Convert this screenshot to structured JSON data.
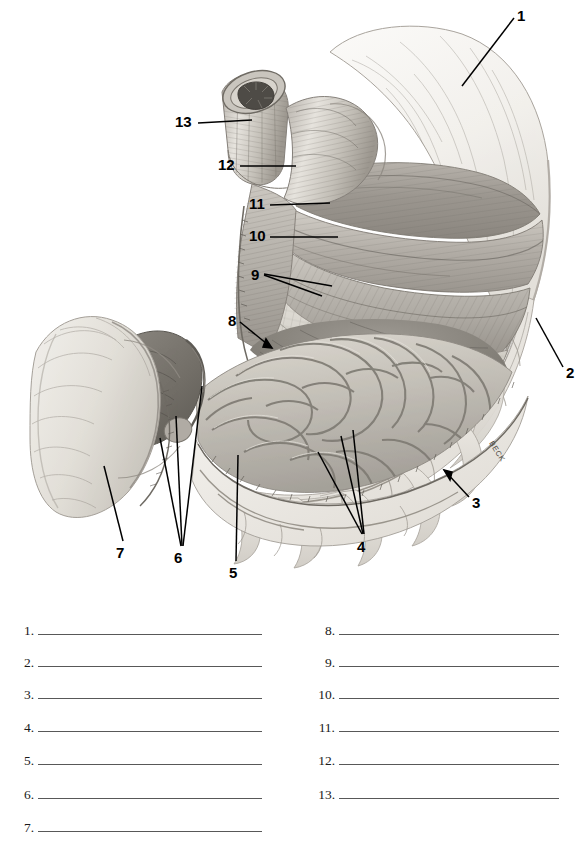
{
  "figure": {
    "artist_signature": "BECK",
    "callouts": [
      {
        "id": "1",
        "label": "1",
        "x": 517,
        "y": 8,
        "leader": "line"
      },
      {
        "id": "2",
        "label": "2",
        "x": 566,
        "y": 365,
        "leader": "line"
      },
      {
        "id": "3",
        "label": "3",
        "x": 472,
        "y": 495,
        "leader": "arrow"
      },
      {
        "id": "4",
        "label": "4",
        "x": 357,
        "y": 539,
        "leader": "triple-line"
      },
      {
        "id": "5",
        "label": "5",
        "x": 229,
        "y": 565,
        "leader": "line"
      },
      {
        "id": "6",
        "label": "6",
        "x": 174,
        "y": 550,
        "leader": "triple-line"
      },
      {
        "id": "7",
        "label": "7",
        "x": 116,
        "y": 545,
        "leader": "line"
      },
      {
        "id": "8",
        "label": "8",
        "x": 228,
        "y": 313,
        "leader": "arrow"
      },
      {
        "id": "9",
        "label": "9",
        "x": 251,
        "y": 267,
        "leader": "double-line"
      },
      {
        "id": "10",
        "label": "10",
        "x": 249,
        "y": 228,
        "leader": "line"
      },
      {
        "id": "11",
        "label": "11",
        "x": 249,
        "y": 196,
        "leader": "line"
      },
      {
        "id": "12",
        "label": "12",
        "x": 218,
        "y": 157,
        "leader": "line"
      },
      {
        "id": "13",
        "label": "13",
        "x": 175,
        "y": 114,
        "leader": "line"
      }
    ]
  },
  "answers": {
    "left_column": [
      {
        "number": "1.",
        "value": ""
      },
      {
        "number": "2.",
        "value": ""
      },
      {
        "number": "3.",
        "value": ""
      },
      {
        "number": "4.",
        "value": ""
      },
      {
        "number": "5.",
        "value": ""
      },
      {
        "number": "6.",
        "value": ""
      },
      {
        "number": "7.",
        "value": ""
      }
    ],
    "right_column": [
      {
        "number": "8.",
        "value": ""
      },
      {
        "number": "9.",
        "value": ""
      },
      {
        "number": "10.",
        "value": ""
      },
      {
        "number": "11.",
        "value": ""
      },
      {
        "number": "12.",
        "value": ""
      },
      {
        "number": "13.",
        "value": ""
      }
    ]
  },
  "colors": {
    "page_background": "#ffffff",
    "ink": "#000000",
    "rule_line": "#585858",
    "serosa_light": "#f0eeea",
    "muscle_mid": "#b9b5ae",
    "muscle_dark": "#8e8a83",
    "mucosa_shadow": "#6f6c66",
    "rugae_light": "#cfcbc4"
  }
}
